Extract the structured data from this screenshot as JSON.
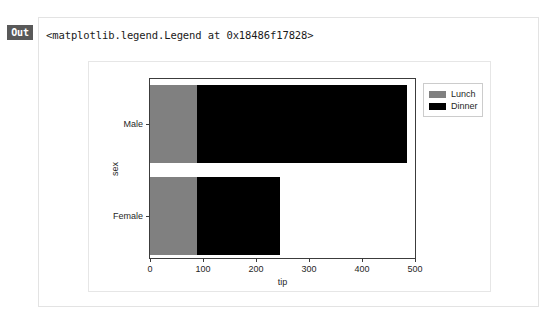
{
  "cell": {
    "prompt_label": "Out",
    "repr_text": "<matplotlib.legend.Legend at 0x18486f17828>"
  },
  "chart_data": {
    "type": "bar",
    "orientation": "horizontal",
    "stacked": true,
    "title": "",
    "xlabel": "tip",
    "ylabel": "sex",
    "categories": [
      "Male",
      "Female"
    ],
    "xticks": [
      0,
      100,
      200,
      300,
      400,
      500
    ],
    "xlim": [
      0,
      500
    ],
    "grid": false,
    "legend_position": "upper right",
    "series": [
      {
        "name": "Lunch",
        "color": "#808080",
        "values": [
          89,
          89
        ]
      },
      {
        "name": "Dinner",
        "color": "#000000",
        "values": [
          396,
          156
        ]
      }
    ],
    "segment_totals": [
      485,
      245
    ],
    "annotations": []
  },
  "colors": {
    "lunch": "#808080",
    "dinner": "#000000",
    "axis": "#3c3c3c",
    "figure_bg": "#ffffff",
    "cell_border": "#e3e3e3",
    "badge_bg": "#595959"
  }
}
